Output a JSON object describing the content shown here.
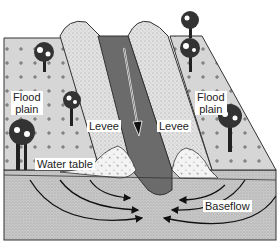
{
  "diagram": {
    "type": "river-floodplain-cross-section",
    "labels": {
      "flood_plain_left": "Flood\nplain",
      "flood_plain_left_line1": "Flood",
      "flood_plain_left_line2": "plain",
      "flood_plain_right_line1": "Flood",
      "flood_plain_right_line2": "plain",
      "levee_left": "Levee",
      "levee_right": "Levee",
      "water_table": "Water table",
      "baseflow": "Baseflow"
    },
    "colors": {
      "floodplain": "#d9d9d9",
      "levee": "#e3e3e3",
      "channel": "#6b6b6b",
      "subsurface": "#cfcfcf",
      "deposit": "#f2f2f2",
      "outline": "#333333",
      "arrow": "#111111"
    },
    "flow_arrow": "downstream-arrow",
    "baseflow_arrows": 6
  }
}
